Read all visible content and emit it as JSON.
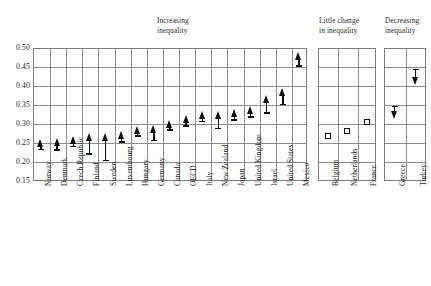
{
  "chart_data": {
    "type": "scatter",
    "title": "",
    "xlabel": "",
    "ylabel": "",
    "ylim": [
      0.15,
      0.5
    ],
    "yticks": [
      0.5,
      0.45,
      0.4,
      0.35,
      0.3,
      0.25,
      0.2,
      0.15
    ],
    "ytick_labels": [
      "0.50",
      "0.45",
      "0.40",
      "0.35",
      "0.30",
      "0.25",
      "0.20",
      "0.15"
    ],
    "grid": true,
    "legend_position": "none",
    "panels": [
      {
        "id": "increasing",
        "title": "Increasing\ninequality",
        "marker": "up-arrow",
        "categories": [
          "Norway",
          "Denmark",
          "Czech Republic",
          "Finland",
          "Sweden",
          "Luxembourg",
          "Hungary",
          "Germany",
          "Canada",
          "OECD",
          "Italy",
          "New Zealand",
          "Japan",
          "United Kingdom",
          "Israel",
          "United States",
          "Mexico"
        ],
        "end_values": [
          0.251,
          0.253,
          0.259,
          0.267,
          0.267,
          0.272,
          0.284,
          0.288,
          0.3,
          0.313,
          0.325,
          0.325,
          0.328,
          0.337,
          0.367,
          0.384,
          0.479
        ],
        "start_values": [
          0.232,
          0.231,
          0.24,
          0.22,
          0.203,
          0.252,
          0.268,
          0.255,
          0.283,
          0.294,
          0.305,
          0.288,
          0.31,
          0.318,
          0.328,
          0.35,
          0.452
        ]
      },
      {
        "id": "little-change",
        "title": "Little change\nin inequality",
        "marker": "square",
        "categories": [
          "Belgium",
          "Netherlands",
          "France"
        ],
        "end_values": [
          0.268,
          0.28,
          0.305
        ],
        "start_values": [
          0.268,
          0.28,
          0.305
        ]
      },
      {
        "id": "decreasing",
        "title": "Decreasing\ninequality",
        "marker": "down-arrow",
        "categories": [
          "Greece",
          "Turkey"
        ],
        "end_values": [
          0.323,
          0.412
        ],
        "start_values": [
          0.345,
          0.442
        ]
      }
    ]
  },
  "geometry": {
    "plot_top": 48,
    "plot_bottom": 181,
    "panel1_left": 33,
    "panel1_right": 307,
    "panel2_left": 318,
    "panel2_right": 376,
    "panel3_left": 384,
    "panel3_right": 426,
    "title_y": 16,
    "xlabel_top": 186
  }
}
